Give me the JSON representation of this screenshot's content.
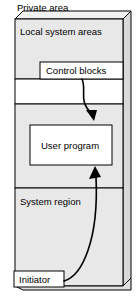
{
  "diagram": {
    "title": "Private area",
    "outer_block": {
      "name": "private-area-block",
      "fill": "#e8e8e8",
      "stroke": "#000000",
      "side_fill": "#d4d4d4",
      "top_fill": "#f0f0f0"
    },
    "regions": [
      {
        "id": "local-system-areas",
        "label": "Local system areas",
        "fill": "#e8e8e8"
      },
      {
        "id": "unlabeled-gap",
        "label": "",
        "fill": "#ffffff"
      },
      {
        "id": "user-program-region",
        "label": "",
        "fill": "#e8e8e8"
      },
      {
        "id": "system-region",
        "label": "System region",
        "fill": "#e8e8e8"
      }
    ],
    "boxes": [
      {
        "id": "control-blocks",
        "label": "Control blocks",
        "fill": "#ffffff",
        "stroke": "#000000"
      },
      {
        "id": "user-program",
        "label": "User program",
        "fill": "#ffffff",
        "stroke": "#000000"
      },
      {
        "id": "initiator",
        "label": "Initiator",
        "fill": "#ffffff",
        "stroke": "#000000"
      }
    ],
    "arrows": [
      {
        "id": "control-blocks-to-user-program",
        "from": "control-blocks",
        "to": "user-program",
        "color": "#000000"
      },
      {
        "id": "initiator-to-user-program",
        "from": "initiator",
        "to": "user-program",
        "color": "#000000"
      }
    ]
  }
}
